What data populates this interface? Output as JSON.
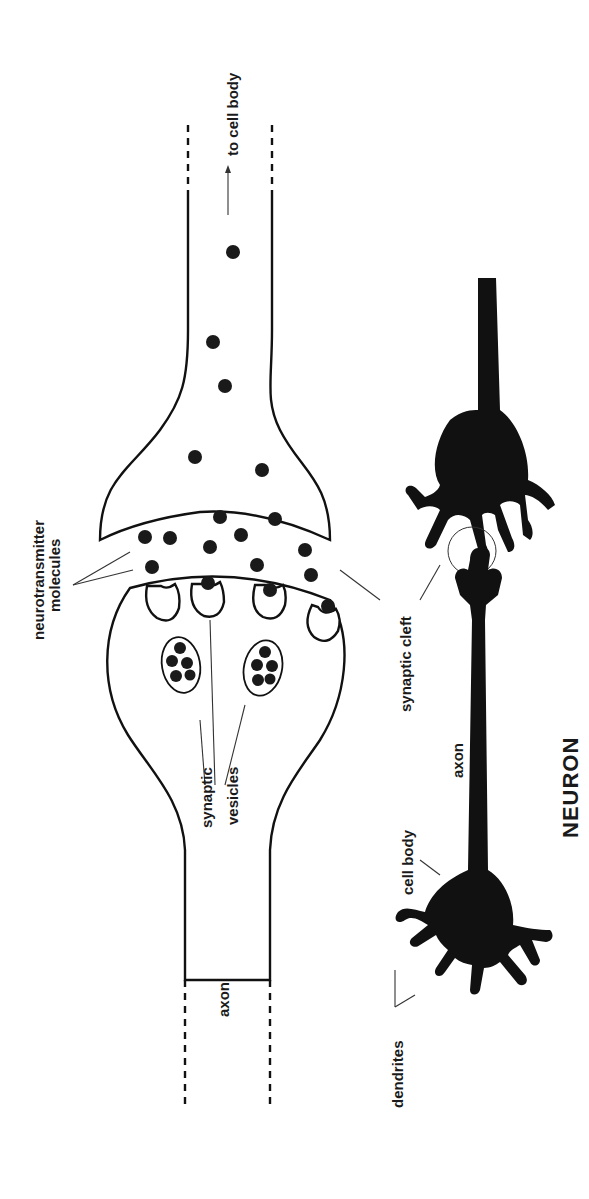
{
  "diagram": {
    "title": "NEURON",
    "orientation": "rotated 90° counter-clockwise (text reads bottom-to-top)",
    "labels": {
      "to_cell_body": "to cell body",
      "neurotransmitter_line1": "neurotransmitter",
      "neurotransmitter_line2": "molecules",
      "synaptic_vesicles_line1": "synaptic",
      "synaptic_vesicles_line2": "vesicles",
      "synaptic_cleft": "synaptic cleft",
      "axon_left": "axon",
      "axon_right": "axon",
      "cell_body": "cell body",
      "dendrites": "dendrites"
    },
    "parts": [
      {
        "name": "post-synaptic dendrite",
        "region": "upper left"
      },
      {
        "name": "pre-synaptic axon terminal",
        "region": "middle left"
      },
      {
        "name": "synaptic cleft with neurotransmitter molecules",
        "region": "center left"
      },
      {
        "name": "synaptic vesicles (2 clusters)",
        "region": "inside axon terminal"
      },
      {
        "name": "neuron silhouette 1 (receiving)",
        "region": "upper right"
      },
      {
        "name": "neuron silhouette 2 (sending, with long axon)",
        "region": "lower right"
      },
      {
        "name": "synapse highlight circle",
        "region": "between right neurons"
      }
    ],
    "colors": {
      "ink": "#111111",
      "background": "#ffffff"
    }
  }
}
